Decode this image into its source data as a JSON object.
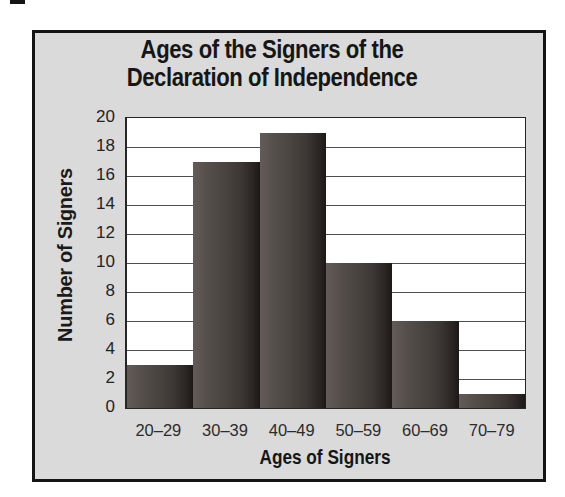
{
  "page": {
    "background": "#ffffff"
  },
  "panel": {
    "background": "#dadada",
    "border_color": "#141414"
  },
  "chart_data": {
    "type": "bar",
    "title": "Ages of the Signers of the Declaration of Independence",
    "title_lines": [
      "Ages of the Signers of the",
      "Declaration of Independence"
    ],
    "categories": [
      "20–29",
      "30–39",
      "40–49",
      "50–59",
      "60–69",
      "70–79"
    ],
    "values": [
      3,
      17,
      19,
      10,
      6,
      1
    ],
    "xlabel": "Ages of Signers",
    "ylabel": "Number of Signers",
    "ylim": [
      0,
      20
    ],
    "yticks": [
      0,
      2,
      4,
      6,
      8,
      10,
      12,
      14,
      16,
      18,
      20
    ],
    "grid": "horizontal-every-2",
    "legend_position": "none",
    "plot_background": "#ffffff",
    "gridline_color": "#4f4f4f",
    "bar_gradient": [
      "#625b57",
      "#4b4542",
      "#2a2523",
      "#1c1817"
    ]
  }
}
